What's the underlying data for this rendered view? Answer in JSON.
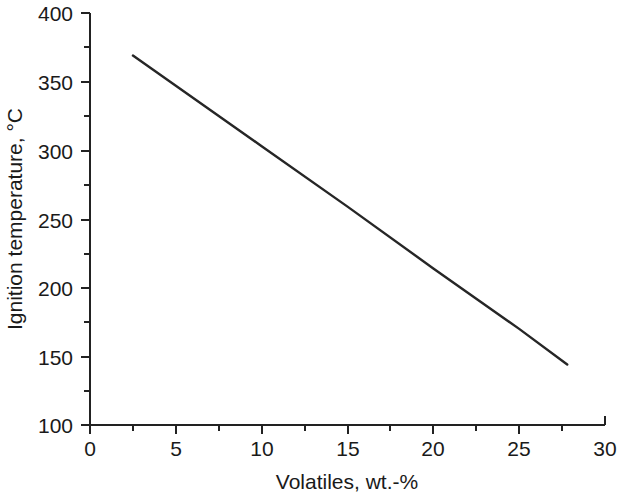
{
  "chart_data": {
    "type": "line",
    "title": "",
    "xlabel": "Volatiles, wt.-%",
    "ylabel": "Ignition temperature, °C",
    "xlim": [
      0,
      30
    ],
    "ylim": [
      100,
      400
    ],
    "x_ticks": [
      0,
      5,
      10,
      15,
      20,
      25,
      30
    ],
    "x_tick_labels": [
      "0",
      "5",
      "10",
      "15",
      "20",
      "25",
      "30"
    ],
    "x_minor_ticks": [
      2.5,
      7.5,
      12.5,
      17.5,
      22.5,
      27.5
    ],
    "y_ticks": [
      100,
      150,
      200,
      250,
      300,
      350,
      400
    ],
    "y_tick_labels": [
      "100",
      "150",
      "200",
      "250",
      "300",
      "350",
      "400"
    ],
    "y_minor_ticks": [
      125,
      175,
      225,
      275,
      325,
      375
    ],
    "grid": false,
    "legend": null,
    "series": [
      {
        "name": "Ignition temperature",
        "color": "#262626",
        "x": [
          2.5,
          27.8
        ],
        "y": [
          369,
          144
        ],
        "points": [
          {
            "x": 2.5,
            "y": 369
          },
          {
            "x": 5.0,
            "y": 347
          },
          {
            "x": 10.0,
            "y": 303
          },
          {
            "x": 15.0,
            "y": 259
          },
          {
            "x": 20.0,
            "y": 214
          },
          {
            "x": 25.0,
            "y": 170
          },
          {
            "x": 27.8,
            "y": 144
          }
        ]
      }
    ]
  },
  "axes": {
    "x_title": "Volatiles, wt.-%",
    "y_title": "Ignition temperature, °C"
  },
  "colors": {
    "axis": "#222222",
    "line": "#262626",
    "text": "#1a1a1a",
    "background": "#ffffff"
  }
}
